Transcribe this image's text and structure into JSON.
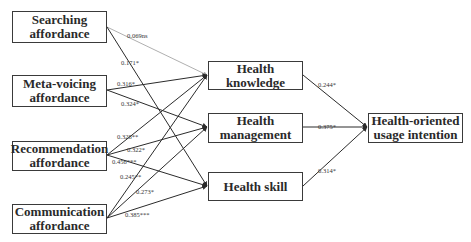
{
  "diagram": {
    "type": "structural-path-model",
    "nodes": {
      "searching": {
        "line1": "Searching",
        "line2": "affordance"
      },
      "meta_voicing": {
        "line1": "Meta-voicing",
        "line2": "affordance"
      },
      "recommendation": {
        "line1": "Recommendation",
        "line2": "affordance"
      },
      "communication": {
        "line1": "Communication",
        "line2": "affordance"
      },
      "health_knowledge": {
        "line1": "Health",
        "line2": "knowledge"
      },
      "health_management": {
        "line1": "Health",
        "line2": "management"
      },
      "health_skill": {
        "line1": "Health skill",
        "line2": ""
      },
      "intention": {
        "line1": "Health-oriented",
        "line2": "usage intention"
      }
    },
    "paths": [
      {
        "from": "searching",
        "to": "health_knowledge",
        "coef": "0.069ns",
        "significant": false
      },
      {
        "from": "searching",
        "to": "health_skill",
        "coef": "0.171*",
        "significant": true
      },
      {
        "from": "meta_voicing",
        "to": "health_knowledge",
        "coef": "0.316*",
        "significant": true
      },
      {
        "from": "meta_voicing",
        "to": "health_management",
        "coef": "0.324*",
        "significant": true
      },
      {
        "from": "recommendation",
        "to": "health_knowledge",
        "coef": "0.328**",
        "significant": true
      },
      {
        "from": "recommendation",
        "to": "health_management",
        "coef": "0.322*",
        "significant": true
      },
      {
        "from": "recommendation",
        "to": "health_skill",
        "coef": "0.456***",
        "significant": true
      },
      {
        "from": "communication",
        "to": "health_knowledge",
        "coef": "0.245**",
        "significant": true
      },
      {
        "from": "communication",
        "to": "health_management",
        "coef": "0.273*",
        "significant": true
      },
      {
        "from": "communication",
        "to": "health_skill",
        "coef": "0.385***",
        "significant": true
      },
      {
        "from": "health_knowledge",
        "to": "intention",
        "coef": "0.244*",
        "significant": true
      },
      {
        "from": "health_management",
        "to": "intention",
        "coef": "0.375*",
        "significant": true
      },
      {
        "from": "health_skill",
        "to": "intention",
        "coef": "0.314*",
        "significant": true
      }
    ],
    "colors": {
      "line": "#2b2b2b",
      "ns_line": "#9a9a9a",
      "box_border": "#3a3a3a"
    }
  }
}
